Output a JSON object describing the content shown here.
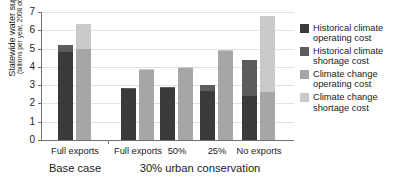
{
  "chart_data": {
    "type": "bar",
    "title": "",
    "subtitle": "",
    "ylabel": "Statewide water supply costs",
    "ylabel_units": "(billions per year, 2008 dollars)",
    "xlabel": "",
    "ylim": [
      0,
      7
    ],
    "yticks": [
      0,
      1,
      2,
      3,
      4,
      5,
      6,
      7
    ],
    "grid": true,
    "legend_position": "right",
    "stacked": true,
    "categories": [
      "Full exports",
      "Full exports",
      "50%",
      "25%",
      "No exports"
    ],
    "group_sections": [
      {
        "label": "Base case",
        "categories": [
          "Full exports"
        ]
      },
      {
        "label": "30% urban conservation",
        "categories": [
          "Full exports",
          "50%",
          "25%",
          "No exports"
        ]
      }
    ],
    "series": [
      {
        "name": "Historical climate operating cost",
        "color": "#3a3a3a",
        "values": [
          4.8,
          2.8,
          2.85,
          2.7,
          2.4
        ]
      },
      {
        "name": "Historical climate shortage cost",
        "color": "#5c5c5c",
        "values": [
          0.4,
          0.05,
          0.05,
          0.3,
          1.95
        ]
      },
      {
        "name": "Climate change operating cost",
        "color": "#a6a6a6",
        "values": [
          5.0,
          3.85,
          3.95,
          4.9,
          2.6
        ]
      },
      {
        "name": "Climate change shortage cost",
        "color": "#c9c9c9",
        "values": [
          1.35,
          0.05,
          0.05,
          0.05,
          4.2
        ]
      }
    ],
    "bar_totals": {
      "historical_climate": [
        5.2,
        2.85,
        2.9,
        3.0,
        4.35
      ],
      "climate_change": [
        6.35,
        3.9,
        4.0,
        4.95,
        6.8
      ]
    }
  },
  "axis": {
    "y_title_line1": "Statewide water supply costs",
    "y_title_line2": "(billions per year, 2008 dollars)",
    "tick_labels": [
      "0",
      "1",
      "2",
      "3",
      "4",
      "5",
      "6",
      "7"
    ]
  },
  "legend": {
    "items": [
      {
        "label": "Historical climate\noperating cost",
        "color": "#3a3a3a"
      },
      {
        "label": "Historical climate\nshortage cost",
        "color": "#5c5c5c"
      },
      {
        "label": "Climate change\noperating cost",
        "color": "#a6a6a6"
      },
      {
        "label": "Climate change\nshortage cost",
        "color": "#c9c9c9"
      }
    ]
  },
  "xaxis": {
    "group_labels": [
      "Full exports",
      "Full exports",
      "50%",
      "25%",
      "No exports"
    ],
    "section_labels": [
      "Base case",
      "30% urban conservation"
    ]
  }
}
